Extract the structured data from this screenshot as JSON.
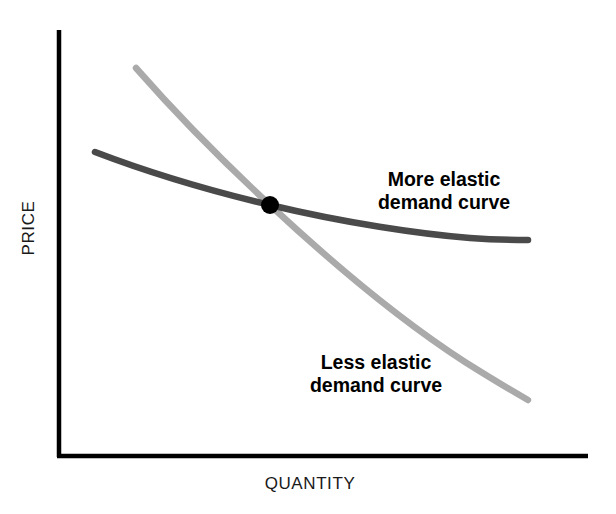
{
  "figure": {
    "background_color": "#ffffff",
    "axis_color": "#000000",
    "intersection_marker_color": "#000000"
  },
  "axes": {
    "y_label": "PRICE",
    "x_label": "QUANTITY"
  },
  "annotations": {
    "more_elastic": {
      "line1": "More elastic",
      "line2": "demand curve"
    },
    "less_elastic": {
      "line1": "Less elastic",
      "line2": "demand curve"
    }
  },
  "chart_data": {
    "type": "line",
    "title": "",
    "subtitle": "",
    "xlabel": "QUANTITY",
    "ylabel": "PRICE",
    "grid": false,
    "legend_position": "inline-annotations",
    "axis_style": "open-left-bottom-spines",
    "xlim": [
      0,
      1
    ],
    "ylim": [
      0,
      1
    ],
    "tick_labels": {
      "x": [],
      "y": []
    },
    "series": [
      {
        "name": "More elastic demand curve",
        "color": "#4a4a4a",
        "line_width": 6,
        "shape": "shallow convex decreasing, flattens to the right",
        "points": [
          {
            "x": 0.07,
            "y": 0.714
          },
          {
            "x": 0.15,
            "y": 0.679
          },
          {
            "x": 0.25,
            "y": 0.636
          },
          {
            "x": 0.35,
            "y": 0.596
          },
          {
            "x": 0.4,
            "y": 0.59
          },
          {
            "x": 0.5,
            "y": 0.555
          },
          {
            "x": 0.6,
            "y": 0.527
          },
          {
            "x": 0.7,
            "y": 0.506
          },
          {
            "x": 0.8,
            "y": 0.492
          },
          {
            "x": 0.9,
            "y": 0.485
          },
          {
            "x": 0.887,
            "y": 0.486
          }
        ]
      },
      {
        "name": "Less elastic demand curve",
        "color": "#aaaaaa",
        "line_width": 6,
        "shape": "steep convex decreasing",
        "points": [
          {
            "x": 0.147,
            "y": 0.911
          },
          {
            "x": 0.2,
            "y": 0.836
          },
          {
            "x": 0.25,
            "y": 0.766
          },
          {
            "x": 0.3,
            "y": 0.7
          },
          {
            "x": 0.4,
            "y": 0.59
          },
          {
            "x": 0.5,
            "y": 0.49
          },
          {
            "x": 0.6,
            "y": 0.4
          },
          {
            "x": 0.7,
            "y": 0.32
          },
          {
            "x": 0.8,
            "y": 0.248
          },
          {
            "x": 0.887,
            "y": 0.187
          }
        ]
      }
    ],
    "markers": [
      {
        "name": "intersection-point",
        "x": 0.4,
        "y": 0.59,
        "color": "#000000",
        "radius_px": 9
      }
    ],
    "annotations": [
      {
        "text": "More elastic demand curve",
        "target_series": "More elastic demand curve",
        "x": 0.728,
        "y": 0.632
      },
      {
        "text": "Less elastic demand curve",
        "target_series": "Less elastic demand curve",
        "x": 0.597,
        "y": 0.203
      }
    ]
  }
}
